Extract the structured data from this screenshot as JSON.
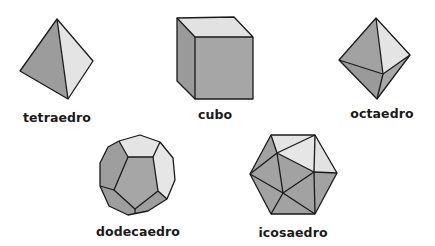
{
  "colors": {
    "face_dark": "#9a9a9a",
    "face_medium": "#a8a8a8",
    "face_light": "#e6e6e6",
    "edge": "#1a1a1a",
    "background": "#ffffff"
  },
  "solids": [
    {
      "id": "tetraedro",
      "label": "tetraedro",
      "faces": 4
    },
    {
      "id": "cubo",
      "label": "cubo",
      "faces": 6
    },
    {
      "id": "octaedro",
      "label": "octaedro",
      "faces": 8
    },
    {
      "id": "dodecaedro",
      "label": "dodecaedro",
      "faces": 12
    },
    {
      "id": "icosaedro",
      "label": "icosaedro",
      "faces": 20
    }
  ]
}
